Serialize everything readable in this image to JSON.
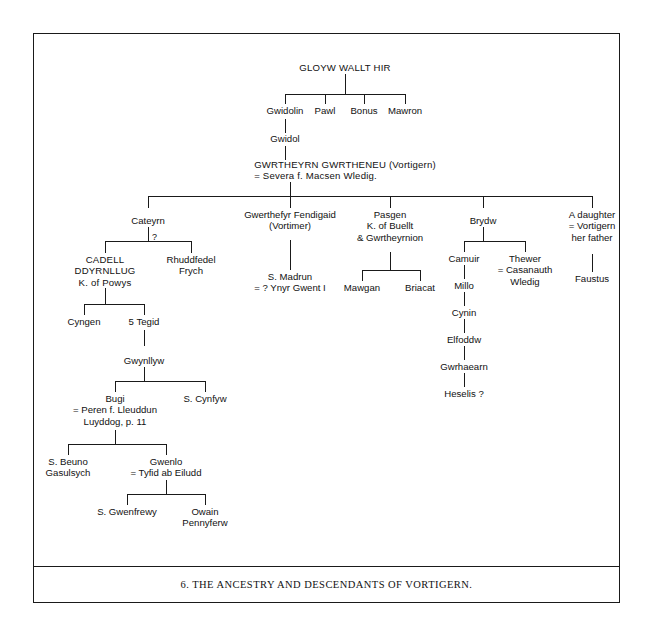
{
  "caption": {
    "text": "6.  THE ANCESTRY AND DESCENDANTS OF VORTIGERN."
  },
  "nodes": {
    "gloyw": {
      "l1": "GLOYW WALLT HIR"
    },
    "gwidolin": {
      "l1": "Gwidolin"
    },
    "pawl": {
      "l1": "Pawl"
    },
    "bonus": {
      "l1": "Bonus"
    },
    "mawron": {
      "l1": "Mawron"
    },
    "gwidol": {
      "l1": "Gwidol"
    },
    "vortigern": {
      "l1": "GWRTHEYRN GWRTHENEU (Vortigern)",
      "l2": "= Severa f. Macsen Wledig."
    },
    "cateyrn": {
      "l1": "Cateyrn"
    },
    "gwerthefyr": {
      "l1": "Gwerthefyr Fendigaid",
      "l2": "(Vortimer)"
    },
    "pasgen": {
      "l1": "Pasgen",
      "l2": "K. of Buellt",
      "l3": "& Gwrtheyrnion"
    },
    "brydw": {
      "l1": "Brydw"
    },
    "daughter": {
      "l1": "A daughter",
      "l2": "= Vortigern",
      "l3": "her father"
    },
    "cadell": {
      "l1": "CADELL",
      "l2": "DDYRNLLUG",
      "l3": "K. of Powys"
    },
    "rhuddfedel": {
      "l1": "Rhuddfedel",
      "l2": "Frych"
    },
    "cateyrn_query": {
      "l1": "?"
    },
    "madrun": {
      "l1": "S. Madrun",
      "l2": "= ? Ynyr Gwent I"
    },
    "mawgan": {
      "l1": "Mawgan"
    },
    "briacat": {
      "l1": "Briacat"
    },
    "camuir": {
      "l1": "Camuir"
    },
    "thewer": {
      "l1": "Thewer",
      "l2": "= Casanauth",
      "l3": "Wledig"
    },
    "faustus": {
      "l1": "Faustus"
    },
    "cyngen": {
      "l1": "Cyngen"
    },
    "tegid": {
      "l1": "5 Tegid"
    },
    "millo": {
      "l1": "Millo"
    },
    "cynin": {
      "l1": "Cynin"
    },
    "elfoddw": {
      "l1": "Elfoddw"
    },
    "gwrhaearn": {
      "l1": "Gwrhaearn"
    },
    "heselis": {
      "l1": "Heselis ?"
    },
    "gwynllyw": {
      "l1": "Gwynllyw"
    },
    "bugi": {
      "l1": "Bugi",
      "l2": "= Peren f. Lleuddun",
      "l3": "Luyddog, p. 11"
    },
    "cynfyw": {
      "l1": "S. Cynfyw"
    },
    "beuno": {
      "l1": "S. Beuno",
      "l2": "Gasulsych"
    },
    "gwenlo": {
      "l1": "Gwenlo",
      "l2": "= Tyfid ab Eiludd"
    },
    "gwenfrewy": {
      "l1": "S. Gwenfrewy"
    },
    "owain": {
      "l1": "Owain",
      "l2": "Pennyferw"
    }
  }
}
